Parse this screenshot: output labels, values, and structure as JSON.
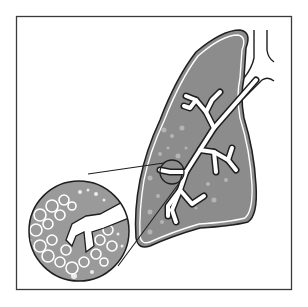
{
  "figure": {
    "colors": {
      "background": "#ffffff",
      "frame": "#3a3a3a",
      "lung_fill": "#8c8c8c",
      "outline": "#1e1e1e",
      "airway": "#ffffff",
      "alveoli_fill": "#9a9a9a"
    },
    "parts": [
      {
        "id": "frame",
        "label": "border frame"
      },
      {
        "id": "lung",
        "label": "lung lobe"
      },
      {
        "id": "trachea",
        "label": "trachea"
      },
      {
        "id": "bronchial-tree",
        "label": "bronchial tree"
      },
      {
        "id": "focus-circle",
        "label": "small focus circle on bronchiole"
      },
      {
        "id": "magnified-view",
        "label": "magnified alveoli circle"
      }
    ]
  }
}
